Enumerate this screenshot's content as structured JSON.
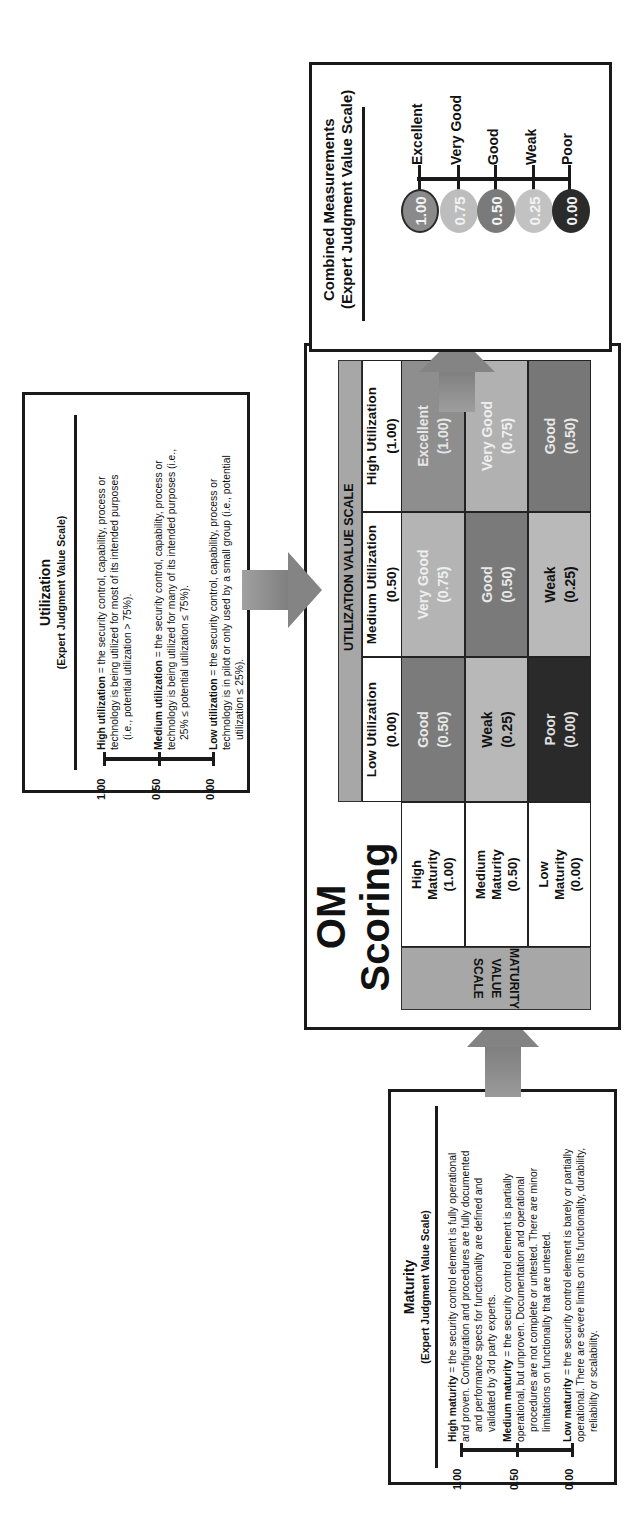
{
  "maturity_scale": {
    "title": "Maturity",
    "subtitle": "(Expert Judgment Value Scale)",
    "levels": [
      {
        "value": "1.00",
        "term": "High maturity",
        "desc_lines": [
          " = the security control element  is fully operational",
          "and proven. Configuration and procedures are  fully documented",
          "and performance specs for functionality are defined and",
          "validated by 3rd party experts."
        ]
      },
      {
        "value": "0.50",
        "term": "Medium maturity",
        "desc_lines": [
          " = the security control element is partially",
          "operational, but unproven. Documentation and operational",
          "procedures are not complete or untested. There are minor",
          "limitations on functionality that are  untested."
        ]
      },
      {
        "value": "0.00",
        "term": "Low maturity",
        "desc_lines": [
          " = the  security control element is barely or partially",
          "operational. There are severe limits on its functionality, durability,",
          "reliability or scalability."
        ]
      }
    ]
  },
  "utilization_scale": {
    "title": "Utilization",
    "subtitle": "(Expert Judgment Value Scale)",
    "levels": [
      {
        "value": "1.00",
        "term": "High utilization",
        "desc_lines": [
          " = the security control, capability, process or",
          "technology  is being utilized for most of its intended purposes",
          "(i.e., potential utilization > 75%)."
        ]
      },
      {
        "value": "0.50",
        "term": "Medium utilization",
        "desc_lines": [
          " = the security control, capability, process or",
          "technology is being utilized for many of its intended purposes (i.e.,",
          "25% ≤ potential utilization ≤ 75%)."
        ]
      },
      {
        "value": "0.00",
        "term": "Low utilization",
        "desc_lines": [
          " = the  security control, capability, process or",
          "technology is in pilot or only used by a small group (i.e., potential",
          "utilization ≤ 25%)."
        ]
      }
    ]
  },
  "matrix": {
    "title_line1": "OM Scoring",
    "title_line2": "Matrix",
    "utilization_header": "UTILIZATION VALUE SCALE",
    "maturity_header_line1": "MATURITY",
    "maturity_header_line2": "VALUE SCALE",
    "columns": [
      {
        "label": "Low Utilization",
        "value": "(0.00)"
      },
      {
        "label": "Medium Utilization",
        "value": "(0.50)"
      },
      {
        "label": "High Utilization",
        "value": "(1.00)"
      }
    ],
    "rows": [
      {
        "label1": "High",
        "label2": "Maturity",
        "value": "(1.00)",
        "cells": [
          {
            "rating": "Good",
            "score": "(0.50)",
            "bg": "#7b7b7b",
            "fg": "#e8e8e8"
          },
          {
            "rating": "Very Good",
            "score": "(0.75)",
            "bg": "#b4b4b4",
            "fg": "#efefef"
          },
          {
            "rating": "Excellent",
            "score": "(1.00)",
            "bg": "#8e8e8e",
            "fg": "#e6e6e6"
          }
        ]
      },
      {
        "label1": "Medium",
        "label2": "Maturity",
        "value": "(0.50)",
        "cells": [
          {
            "rating": "Weak",
            "score": "(0.25)",
            "bg": "#b8b8b8",
            "fg": "#111111"
          },
          {
            "rating": "Good",
            "score": "(0.50)",
            "bg": "#7a7a7a",
            "fg": "#e8e8e8"
          },
          {
            "rating": "Very Good",
            "score": "(0.75)",
            "bg": "#b1b1b1",
            "fg": "#efefef"
          }
        ]
      },
      {
        "label1": "Low",
        "label2": "Maturity",
        "value": "(0.00)",
        "cells": [
          {
            "rating": "Poor",
            "score": "(0.00)",
            "bg": "#2a2a2a",
            "fg": "#e0e0e0"
          },
          {
            "rating": "Weak",
            "score": "(0.25)",
            "bg": "#b9b9b9",
            "fg": "#111111"
          },
          {
            "rating": "Good",
            "score": "(0.50)",
            "bg": "#777777",
            "fg": "#e8e8e8"
          }
        ]
      }
    ]
  },
  "combined": {
    "title_line1": "Combined Measurements",
    "title_line2": "(Expert Judgment Value Scale)",
    "levels": [
      {
        "value": "1.00",
        "label": "Excellent",
        "color": "#8a8a8a",
        "outline": "#2a2a2a"
      },
      {
        "value": "0.75",
        "label": "Very Good",
        "color": "#bdbdbd",
        "outline": "#bdbdbd"
      },
      {
        "value": "0.50",
        "label": "Good",
        "color": "#7a7a7a",
        "outline": "#7a7a7a"
      },
      {
        "value": "0.25",
        "label": "Weak",
        "color": "#c2c2c2",
        "outline": "#c2c2c2"
      },
      {
        "value": "0.00",
        "label": "Poor",
        "color": "#2b2b2b",
        "outline": "#2b2b2b"
      }
    ]
  },
  "colors": {
    "border": "#1a1a1a",
    "header_gray": "#a7a7a7",
    "arrow_gray": "#8c8c8c"
  }
}
